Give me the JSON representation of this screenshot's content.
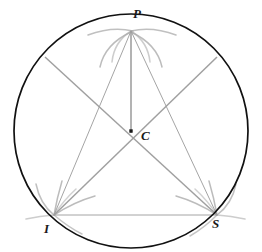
{
  "figure": {
    "background_color": "#ffffff",
    "width": 262,
    "height": 252
  },
  "colors": {
    "circle_stroke": "#111111",
    "construction_arc": "#a8a8a8",
    "chord_line": "#9a9a9a",
    "thin_line": "#8c8c8c",
    "center_dot": "#1a1a1a",
    "label_color": "#1a1a1a"
  },
  "labels": {
    "apex": "P",
    "center": "C",
    "left_vertex": "I",
    "right_vertex": "S"
  },
  "circle": {
    "center_x": 131,
    "center_y": 131,
    "radius": 117,
    "stroke_width": 1.6
  },
  "points": {
    "P": {
      "x": 131,
      "y": 31
    },
    "C": {
      "x": 131,
      "y": 131
    },
    "I": {
      "x": 54,
      "y": 215
    },
    "S": {
      "x": 217,
      "y": 215
    },
    "upper_left_end": {
      "x": 45,
      "y": 57
    },
    "upper_right_end": {
      "x": 217,
      "y": 57
    }
  },
  "segments": [
    {
      "name": "apex-to-center-vertical",
      "from": "P",
      "to": "C",
      "style": "medium"
    },
    {
      "name": "chord-i-to-s",
      "from": "I",
      "to": "S",
      "style": "thin"
    },
    {
      "name": "chord-p-to-i",
      "from": "P",
      "to": "I",
      "style": "thin"
    },
    {
      "name": "chord-p-to-s",
      "from": "P",
      "to": "S",
      "style": "thin"
    },
    {
      "name": "diameter-upper-left-to-s",
      "from": "upper_left_end",
      "to": "S",
      "style": "medium"
    },
    {
      "name": "diameter-upper-right-to-i",
      "from": "upper_right_end",
      "to": "I",
      "style": "medium"
    }
  ],
  "construction_arcs": {
    "count_at_apex": 4,
    "count_at_left_vertex": 4,
    "count_at_right_vertex": 4,
    "description": "compass arc pairs crossing at each triangle vertex"
  }
}
